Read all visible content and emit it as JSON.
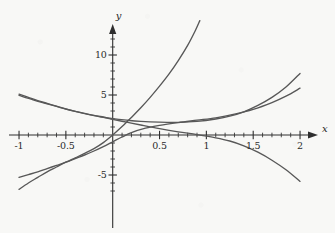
{
  "chart_data": {
    "type": "line",
    "title": "",
    "subtitle": "",
    "xlabel": "x",
    "ylabel": "y",
    "xlim": [
      -1.08,
      2.12
    ],
    "ylim": [
      -8.2,
      14.6
    ],
    "grid": false,
    "legend": null,
    "legend_position": "none",
    "axis_style": "cartesian-cross-with-arrows",
    "x_ticks_major": [
      -1,
      -0.5,
      0.5,
      1,
      1.5,
      2
    ],
    "x_tick_labels": [
      "-1",
      "-0.5",
      "0.5",
      "1",
      "1.5",
      "2"
    ],
    "x_ticks_minor": [
      -0.9,
      -0.8,
      -0.7,
      -0.6,
      -0.4,
      -0.3,
      -0.2,
      -0.1,
      0.1,
      0.2,
      0.3,
      0.4,
      0.6,
      0.7,
      0.8,
      0.9,
      1.1,
      1.2,
      1.3,
      1.4,
      1.6,
      1.7,
      1.8,
      1.9
    ],
    "y_ticks_major": [
      -5,
      5,
      10
    ],
    "y_tick_labels": [
      "-5",
      "5",
      "10"
    ],
    "y_ticks_minor": [
      -7,
      -6,
      -4,
      -3,
      -2,
      -1,
      1,
      2,
      3,
      4,
      6,
      7,
      8,
      9,
      11,
      12,
      13
    ],
    "curve_color": "#585858",
    "axis_color": "#2e2e2e",
    "series": [
      {
        "name": "steep-rising-exponential",
        "stroke": "#585858",
        "points": [
          [
            -1.0,
            -6.8
          ],
          [
            -0.9,
            -6.0
          ],
          [
            -0.8,
            -5.3
          ],
          [
            -0.7,
            -4.6
          ],
          [
            -0.6,
            -4.0
          ],
          [
            -0.5,
            -3.4
          ],
          [
            -0.4,
            -2.85
          ],
          [
            -0.3,
            -2.3
          ],
          [
            -0.2,
            -1.7
          ],
          [
            -0.1,
            -0.95
          ],
          [
            0.0,
            0.0
          ],
          [
            0.1,
            1.05
          ],
          [
            0.2,
            2.2
          ],
          [
            0.3,
            3.4
          ],
          [
            0.4,
            4.7
          ],
          [
            0.5,
            6.1
          ],
          [
            0.6,
            7.6
          ],
          [
            0.7,
            9.3
          ],
          [
            0.8,
            11.2
          ],
          [
            0.88,
            13.0
          ],
          [
            0.93,
            14.3
          ]
        ]
      },
      {
        "name": "shallow-rising-curve",
        "stroke": "#585858",
        "points": [
          [
            -1.0,
            -5.3
          ],
          [
            -0.9,
            -4.95
          ],
          [
            -0.8,
            -4.6
          ],
          [
            -0.7,
            -4.2
          ],
          [
            -0.6,
            -3.8
          ],
          [
            -0.5,
            -3.4
          ],
          [
            -0.4,
            -2.95
          ],
          [
            -0.3,
            -2.5
          ],
          [
            -0.2,
            -2.0
          ],
          [
            -0.1,
            -1.45
          ],
          [
            0.0,
            -0.85
          ],
          [
            0.1,
            -0.25
          ],
          [
            0.2,
            0.3
          ],
          [
            0.35,
            0.85
          ],
          [
            0.5,
            1.2
          ],
          [
            0.7,
            1.55
          ],
          [
            0.9,
            1.85
          ],
          [
            1.1,
            2.15
          ],
          [
            1.3,
            2.6
          ],
          [
            1.5,
            3.2
          ],
          [
            1.7,
            4.05
          ],
          [
            1.85,
            4.85
          ],
          [
            2.0,
            5.85
          ]
        ]
      },
      {
        "name": "upper-decaying-then-rising-curve",
        "stroke": "#585858",
        "points": [
          [
            -1.0,
            5.1
          ],
          [
            -0.9,
            4.7
          ],
          [
            -0.8,
            4.3
          ],
          [
            -0.7,
            3.95
          ],
          [
            -0.6,
            3.6
          ],
          [
            -0.5,
            3.25
          ],
          [
            -0.4,
            2.95
          ],
          [
            -0.3,
            2.7
          ],
          [
            -0.2,
            2.45
          ],
          [
            -0.1,
            2.25
          ],
          [
            0.0,
            2.05
          ],
          [
            0.15,
            1.85
          ],
          [
            0.3,
            1.7
          ],
          [
            0.5,
            1.6
          ],
          [
            0.7,
            1.58
          ],
          [
            0.9,
            1.7
          ],
          [
            1.1,
            2.0
          ],
          [
            1.25,
            2.35
          ],
          [
            1.4,
            2.9
          ],
          [
            1.55,
            3.7
          ],
          [
            1.7,
            4.7
          ],
          [
            1.85,
            6.0
          ],
          [
            2.0,
            7.7
          ]
        ]
      },
      {
        "name": "descending-crossing-curve",
        "stroke": "#585858",
        "points": [
          [
            -1.0,
            4.95
          ],
          [
            -0.85,
            4.4
          ],
          [
            -0.7,
            3.9
          ],
          [
            -0.55,
            3.4
          ],
          [
            -0.4,
            2.95
          ],
          [
            -0.25,
            2.55
          ],
          [
            -0.1,
            2.2
          ],
          [
            0.0,
            1.95
          ],
          [
            0.15,
            1.6
          ],
          [
            0.3,
            1.25
          ],
          [
            0.5,
            0.8
          ],
          [
            0.7,
            0.4
          ],
          [
            0.9,
            0.05
          ],
          [
            1.1,
            -0.35
          ],
          [
            1.25,
            -0.75
          ],
          [
            1.4,
            -1.35
          ],
          [
            1.55,
            -2.15
          ],
          [
            1.7,
            -3.15
          ],
          [
            1.85,
            -4.35
          ],
          [
            2.0,
            -5.8
          ]
        ]
      }
    ]
  },
  "axes": {
    "x_axis_name": "x",
    "y_axis_name": "y"
  }
}
